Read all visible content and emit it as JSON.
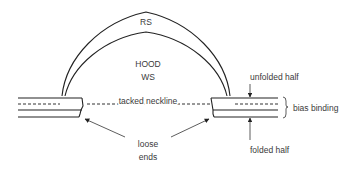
{
  "diagram": {
    "labels": {
      "rs": "RS",
      "hood": "HOOD",
      "ws": "WS",
      "tacked_neckline": "tacked neckline",
      "unfolded_half": "unfolded half",
      "bias_binding": "bias binding",
      "folded_half": "folded half",
      "loose_line1": "loose",
      "loose_line2": "ends"
    },
    "colors": {
      "line": "#222222",
      "text": "#3a3a3a",
      "background": "#ffffff"
    }
  }
}
